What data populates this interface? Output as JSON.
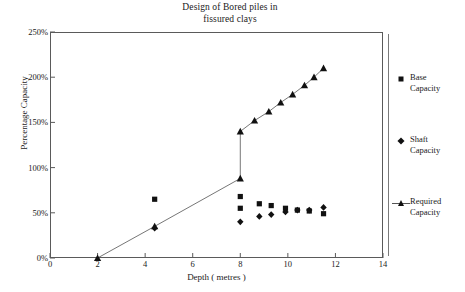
{
  "chart_data": {
    "type": "scatter",
    "title": "Design of Bored piles in fissured clays",
    "title_lines": [
      "Design of Bored piles in",
      "fissured clays"
    ],
    "xlabel": "Depth ( metres )",
    "ylabel": "Percentage Capacity",
    "xlim": [
      0,
      14
    ],
    "ylim": [
      0,
      250
    ],
    "xticks": [
      0,
      2,
      4,
      6,
      8,
      10,
      12,
      14
    ],
    "xtick_labels": [
      "0",
      "2",
      "4",
      "6",
      "8",
      "10",
      "12",
      "14"
    ],
    "yticks": [
      0,
      50,
      100,
      150,
      200,
      250
    ],
    "ytick_labels": [
      "0%",
      "50%",
      "100%",
      "150%",
      "200%",
      "250%"
    ],
    "grid": false,
    "legend_position": "right",
    "series": [
      {
        "name": "Base Capacity",
        "label_lines": [
          "Base",
          "Capacity"
        ],
        "marker": "square",
        "line": false,
        "color": "#111111",
        "points": [
          {
            "x": 4.4,
            "y": 65
          },
          {
            "x": 8.0,
            "y": 68
          },
          {
            "x": 8.0,
            "y": 55
          },
          {
            "x": 8.8,
            "y": 60
          },
          {
            "x": 9.3,
            "y": 58
          },
          {
            "x": 9.9,
            "y": 55
          },
          {
            "x": 10.4,
            "y": 53
          },
          {
            "x": 10.9,
            "y": 52
          },
          {
            "x": 11.5,
            "y": 49
          }
        ]
      },
      {
        "name": "Shaft Capacity",
        "label_lines": [
          "Shaft",
          "Capacity"
        ],
        "marker": "diamond",
        "line": false,
        "color": "#111111",
        "points": [
          {
            "x": 4.4,
            "y": 33
          },
          {
            "x": 8.0,
            "y": 40
          },
          {
            "x": 8.8,
            "y": 46
          },
          {
            "x": 9.3,
            "y": 48
          },
          {
            "x": 9.9,
            "y": 51
          },
          {
            "x": 10.4,
            "y": 53
          },
          {
            "x": 10.9,
            "y": 53
          },
          {
            "x": 11.5,
            "y": 56
          }
        ]
      },
      {
        "name": "Required Capacity",
        "label_lines": [
          "Required",
          "Capacity"
        ],
        "marker": "triangle",
        "line": true,
        "color": "#111111",
        "points": [
          {
            "x": 2.0,
            "y": 0
          },
          {
            "x": 4.4,
            "y": 35
          },
          {
            "x": 8.0,
            "y": 88
          },
          {
            "x": 8.0,
            "y": 140
          },
          {
            "x": 8.6,
            "y": 152
          },
          {
            "x": 9.2,
            "y": 162
          },
          {
            "x": 9.7,
            "y": 172
          },
          {
            "x": 10.2,
            "y": 181
          },
          {
            "x": 10.7,
            "y": 191
          },
          {
            "x": 11.1,
            "y": 200
          },
          {
            "x": 11.5,
            "y": 210
          }
        ]
      }
    ]
  }
}
